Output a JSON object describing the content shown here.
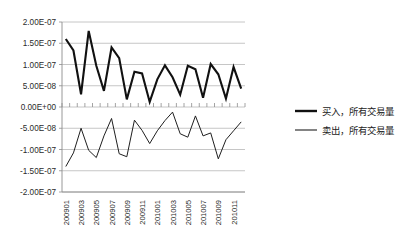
{
  "chart_data": {
    "type": "line",
    "title": "",
    "xlabel": "",
    "ylabel": "",
    "grid": true,
    "legend_position": "right",
    "ylim": [
      -2e-07,
      2e-07
    ],
    "ytick_labels": [
      "2.00E-07",
      "1.50E-07",
      "1.00E-07",
      "5.00E-08",
      "0.00E+00",
      "-5.00E-08",
      "-1.00E-07",
      "-1.50E-07",
      "-2.00E-07"
    ],
    "ytick_values": [
      2e-07,
      1.5e-07,
      1e-07,
      5e-08,
      0.0,
      -5e-08,
      -1e-07,
      -1.5e-07,
      -2e-07
    ],
    "x": [
      "200901",
      "200902",
      "200903",
      "200904",
      "200905",
      "200906",
      "200907",
      "200908",
      "200909",
      "200910",
      "200911",
      "200912",
      "201001",
      "201002",
      "201003",
      "201004",
      "201005",
      "201006",
      "201007",
      "201008",
      "201009",
      "201010",
      "201011",
      "201012"
    ],
    "xtick_labels": [
      "200901",
      "200903",
      "200905",
      "200907",
      "200909",
      "200911",
      "201001",
      "201003",
      "201005",
      "201007",
      "201009",
      "201011"
    ],
    "xtick_label_rotation": -90,
    "series": [
      {
        "name": "买入，所有交易量",
        "values": [
          1.6e-07,
          1.33e-07,
          3e-08,
          1.79e-07,
          9.7e-08,
          3.8e-08,
          1.4e-07,
          1.15e-07,
          1.8e-08,
          8.3e-08,
          7.9e-08,
          1.2e-08,
          6.5e-08,
          9.8e-08,
          7e-08,
          2.9e-08,
          9.7e-08,
          8.9e-08,
          2.2e-08,
          1.01e-07,
          7.7e-08,
          2e-08,
          9.4e-08,
          4.3e-08
        ]
      },
      {
        "name": "卖出，所有交易量",
        "values": [
          -1.4e-07,
          -1.08e-07,
          -5e-08,
          -1.02e-07,
          -1.19e-07,
          -6.8e-08,
          -2.7e-08,
          -1.1e-07,
          -1.17e-07,
          -3.1e-08,
          -5.5e-08,
          -8.6e-08,
          -5.6e-08,
          -3.2e-08,
          -1.2e-08,
          -6.3e-08,
          -7.1e-08,
          -2.1e-08,
          -6.8e-08,
          -6.1e-08,
          -1.22e-07,
          -7.7e-08,
          -5.6e-08,
          -3.5e-08
        ]
      }
    ]
  },
  "legend": {
    "items": [
      {
        "label": "买入，所有交易量"
      },
      {
        "label": "卖出，所有交易量"
      }
    ]
  }
}
